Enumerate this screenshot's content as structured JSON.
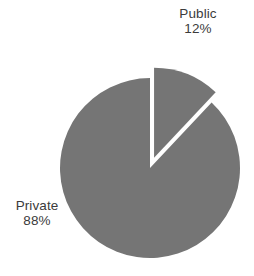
{
  "chart_data": {
    "type": "pie",
    "title": "",
    "categories": [
      "Public",
      "Private"
    ],
    "values": [
      12,
      88
    ],
    "units": "percent",
    "labels": [
      "Public\n12%",
      "Private\n88%"
    ],
    "legend": "none",
    "slices": [
      {
        "name": "Public",
        "value": 12,
        "value_label": "12%",
        "color": "#757575",
        "exploded": true,
        "start_angle_deg": 0,
        "end_angle_deg": 43.2
      },
      {
        "name": "Private",
        "value": 88,
        "value_label": "88%",
        "color": "#757575",
        "exploded": false,
        "start_angle_deg": 43.2,
        "end_angle_deg": 360
      }
    ],
    "colors": {
      "slice_fill": "#757575",
      "background": "#ffffff",
      "label_text": "#3b3b3b"
    },
    "geometry": {
      "center_x": 150,
      "center_y": 168,
      "radius": 90,
      "explode_offset": 11
    }
  },
  "labels": {
    "public": {
      "name": "Public",
      "value": "12%"
    },
    "private": {
      "name": "Private",
      "value": "88%"
    }
  }
}
